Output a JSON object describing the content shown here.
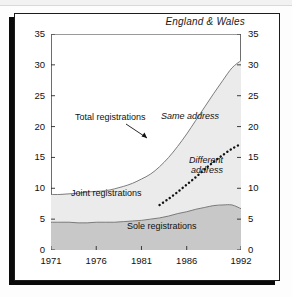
{
  "figure": {
    "title": "England & Wales",
    "panel_background": "#ffffff",
    "frame_color": "#1c1c1c"
  },
  "axes": {
    "y_ticks": [
      "0",
      "5",
      "10",
      "15",
      "20",
      "25",
      "30",
      "35"
    ],
    "x_ticks": [
      "1971",
      "1976",
      "1981",
      "1986",
      "1992"
    ],
    "y_min": 0,
    "y_max": 35,
    "x_min": 1971,
    "x_max": 1992
  },
  "annotations": {
    "total": "Total registrations",
    "same_address": "Same address",
    "different_address_line1": "Different",
    "different_address_line2": "address",
    "joint": "Joint registrations",
    "sole": "Sole registrations"
  },
  "colors": {
    "sole_fill": "#c8c8c8",
    "joint_fill": "#ebebeb",
    "line": "#6e6e6e",
    "dotted": "#111111",
    "axis": "#2a2a2a"
  },
  "chart_data": {
    "type": "area",
    "title": "England & Wales",
    "xlabel": "",
    "ylabel": "",
    "xlim": [
      1971,
      1992
    ],
    "ylim": [
      0,
      35
    ],
    "grid": false,
    "legend": "in-plot labels",
    "x": [
      1971,
      1972,
      1973,
      1974,
      1975,
      1976,
      1977,
      1978,
      1979,
      1980,
      1981,
      1982,
      1983,
      1984,
      1985,
      1986,
      1987,
      1988,
      1989,
      1990,
      1991,
      1992
    ],
    "series": [
      {
        "name": "Sole registrations",
        "type": "area-band",
        "values": [
          4.5,
          4.5,
          4.5,
          4.4,
          4.4,
          4.5,
          4.5,
          4.5,
          4.6,
          4.7,
          4.8,
          5.0,
          5.2,
          5.5,
          5.9,
          6.2,
          6.6,
          6.9,
          7.2,
          7.3,
          7.3,
          6.7
        ]
      },
      {
        "name": "Joint registrations",
        "type": "area-band",
        "values": [
          4.5,
          4.5,
          4.6,
          4.8,
          5.0,
          5.0,
          5.1,
          5.4,
          5.7,
          6.1,
          6.7,
          7.3,
          8.3,
          9.5,
          10.9,
          12.6,
          14.4,
          16.3,
          18.2,
          20.2,
          22.2,
          24.0
        ]
      },
      {
        "name": "Total registrations",
        "type": "line",
        "values": [
          9.0,
          9.0,
          9.1,
          9.2,
          9.4,
          9.5,
          9.6,
          9.9,
          10.3,
          10.8,
          11.5,
          12.3,
          13.5,
          15.0,
          16.8,
          18.8,
          21.0,
          23.2,
          25.4,
          27.5,
          29.5,
          30.7
        ]
      },
      {
        "name": "Same address",
        "type": "dotted-line",
        "x": [
          1983,
          1984,
          1985,
          1986,
          1987,
          1988,
          1989,
          1990,
          1991,
          1992
        ],
        "values": [
          7.3,
          8.3,
          9.4,
          10.6,
          11.8,
          13.1,
          14.3,
          15.4,
          16.4,
          17.2
        ]
      }
    ]
  }
}
